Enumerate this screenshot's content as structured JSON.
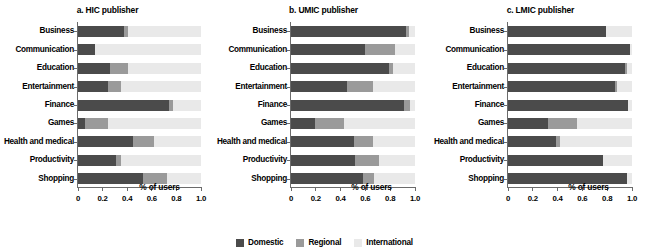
{
  "figure": {
    "xlabel": "% of users",
    "legend_title": "",
    "colors": {
      "domestic": "#4b4b4b",
      "regional": "#9a9a9a",
      "international": "#e9e9e9"
    }
  },
  "legend": {
    "position": "bottom-center",
    "items": [
      {
        "label": "Domestic",
        "color": "#4b4b4b",
        "key": "domestic"
      },
      {
        "label": "Regional",
        "color": "#9a9a9a",
        "key": "regional"
      },
      {
        "label": "International",
        "color": "#e9e9e9",
        "key": "international"
      }
    ]
  },
  "axis": {
    "ticks": [
      "0",
      "0.2",
      "0.4",
      "0.6",
      "0.8",
      "1.0"
    ],
    "tick_values": [
      0,
      0.2,
      0.4,
      0.6,
      0.8,
      1.0
    ],
    "xlim": [
      0,
      1.0
    ]
  },
  "categories": [
    "Business",
    "Communication",
    "Education",
    "Entertainment",
    "Finance",
    "Games",
    "Health and medical",
    "Productivity",
    "Shopping"
  ],
  "chart_data": [
    {
      "type": "bar",
      "orientation": "horizontal",
      "stacked": true,
      "title": "a. HIC publisher",
      "xlabel": "% of users",
      "ylabel": "",
      "xlim": [
        0,
        1.0
      ],
      "xticks": [
        0,
        0.2,
        0.4,
        0.6,
        0.8,
        1.0
      ],
      "xticklabels": [
        "0",
        "0.2",
        "0.4",
        "0.6",
        "0.8",
        "1.0"
      ],
      "grid": false,
      "categories": [
        "Business",
        "Communication",
        "Education",
        "Entertainment",
        "Finance",
        "Games",
        "Health and medical",
        "Productivity",
        "Shopping"
      ],
      "series": [
        {
          "name": "Domestic",
          "color": "#4b4b4b",
          "values": [
            0.37,
            0.14,
            0.26,
            0.24,
            0.74,
            0.06,
            0.45,
            0.31,
            0.53
          ]
        },
        {
          "name": "Regional",
          "color": "#9a9a9a",
          "values": [
            0.04,
            0.0,
            0.15,
            0.11,
            0.03,
            0.18,
            0.17,
            0.04,
            0.19
          ]
        },
        {
          "name": "International",
          "color": "#e9e9e9",
          "values": [
            0.59,
            0.86,
            0.59,
            0.65,
            0.23,
            0.76,
            0.38,
            0.65,
            0.28
          ]
        }
      ]
    },
    {
      "type": "bar",
      "orientation": "horizontal",
      "stacked": true,
      "title": "b. UMIC publisher",
      "xlabel": "% of users",
      "ylabel": "",
      "xlim": [
        0,
        1.0
      ],
      "xticks": [
        0,
        0.2,
        0.4,
        0.6,
        0.8,
        1.0
      ],
      "xticklabels": [
        "0",
        "0.2",
        "0.4",
        "0.6",
        "0.8",
        "1.0"
      ],
      "grid": false,
      "categories": [
        "Business",
        "Communication",
        "Education",
        "Entertainment",
        "Finance",
        "Games",
        "Health and medical",
        "Productivity",
        "Shopping"
      ],
      "series": [
        {
          "name": "Domestic",
          "color": "#4b4b4b",
          "values": [
            0.93,
            0.6,
            0.79,
            0.45,
            0.91,
            0.19,
            0.51,
            0.52,
            0.58
          ]
        },
        {
          "name": "Regional",
          "color": "#9a9a9a",
          "values": [
            0.02,
            0.24,
            0.03,
            0.21,
            0.05,
            0.24,
            0.15,
            0.19,
            0.09
          ]
        },
        {
          "name": "International",
          "color": "#e9e9e9",
          "values": [
            0.05,
            0.16,
            0.18,
            0.34,
            0.04,
            0.57,
            0.34,
            0.29,
            0.33
          ]
        }
      ]
    },
    {
      "type": "bar",
      "orientation": "horizontal",
      "stacked": true,
      "title": "c. LMIC publisher",
      "xlabel": "% of users",
      "ylabel": "",
      "xlim": [
        0,
        1.0
      ],
      "xticks": [
        0,
        0.2,
        0.4,
        0.6,
        0.8,
        1.0
      ],
      "xticklabels": [
        "0",
        "0.2",
        "0.4",
        "0.6",
        "0.8",
        "1.0"
      ],
      "grid": false,
      "categories": [
        "Business",
        "Communication",
        "Education",
        "Entertainment",
        "Finance",
        "Games",
        "Health and medical",
        "Productivity",
        "Shopping"
      ],
      "series": [
        {
          "name": "Domestic",
          "color": "#4b4b4b",
          "values": [
            0.79,
            0.98,
            0.94,
            0.86,
            0.97,
            0.32,
            0.39,
            0.77,
            0.96
          ]
        },
        {
          "name": "Regional",
          "color": "#9a9a9a",
          "values": [
            0.0,
            0.0,
            0.02,
            0.02,
            0.0,
            0.24,
            0.03,
            0.0,
            0.0
          ]
        },
        {
          "name": "International",
          "color": "#e9e9e9",
          "values": [
            0.21,
            0.02,
            0.04,
            0.12,
            0.03,
            0.44,
            0.58,
            0.23,
            0.04
          ]
        }
      ]
    }
  ]
}
